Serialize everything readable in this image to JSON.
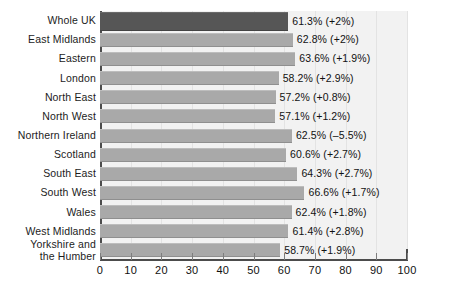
{
  "chart_data": {
    "type": "bar",
    "orientation": "horizontal",
    "title": "",
    "subtitle": "",
    "xlabel": "",
    "ylabel": "",
    "xlim": [
      0,
      100
    ],
    "grid": true,
    "legend": null,
    "series_name": "Percentage (change)",
    "categories": [
      "Whole UK",
      "East Midlands",
      "Eastern",
      "London",
      "North East",
      "North West",
      "Northern Ireland",
      "Scotland",
      "South East",
      "South West",
      "Wales",
      "West Midlands",
      "Yorkshire and the Humber"
    ],
    "values": [
      61.3,
      62.8,
      63.6,
      58.2,
      57.2,
      57.1,
      62.5,
      60.6,
      64.3,
      66.6,
      62.4,
      61.4,
      58.7
    ],
    "changes": [
      "+2%",
      "+2%",
      "+1.9%",
      "+2.9%",
      "+0.8%",
      "+1.2%",
      "-5.5%",
      "+2.7%",
      "+2.7%",
      "+1.7%",
      "+1.8%",
      "+2.8%",
      "+1.9%"
    ],
    "data_labels": [
      "61.3% (+2%)",
      "62.8% (+2%)",
      "63.6% (+1.9%)",
      "58.2% (+2.9%)",
      "57.2% (+0.8%)",
      "57.1% (+1.2%)",
      "62.5% (–5.5%)",
      "60.6% (+2.7%)",
      "64.3% (+2.7%)",
      "66.6% (+1.7%)",
      "62.4% (+1.8%)",
      "61.4% (+2.8%)",
      "58.7% (+1.9%)"
    ],
    "xticks": [
      0,
      10,
      20,
      30,
      40,
      50,
      60,
      70,
      80,
      90,
      100
    ],
    "xtick_labels": [
      "0",
      "10",
      "20",
      "30",
      "40",
      "50",
      "60",
      "70",
      "80",
      "90",
      "100"
    ],
    "highlight_index": 0,
    "colors": {
      "highlight_bar": "#565656",
      "bar": "#a9a9a9",
      "plot_background": "#f2f2f2",
      "axis": "#4c4c4c",
      "gridline": "#e3e3e3",
      "text": "#111111"
    }
  },
  "rows": [
    {
      "label": "Whole UK",
      "label2": "",
      "value_label": "61.3% (+2%)"
    },
    {
      "label": "East Midlands",
      "label2": "",
      "value_label": "62.8% (+2%)"
    },
    {
      "label": "Eastern",
      "label2": "",
      "value_label": "63.6% (+1.9%)"
    },
    {
      "label": "London",
      "label2": "",
      "value_label": "58.2% (+2.9%)"
    },
    {
      "label": "North East",
      "label2": "",
      "value_label": "57.2% (+0.8%)"
    },
    {
      "label": "North West",
      "label2": "",
      "value_label": "57.1% (+1.2%)"
    },
    {
      "label": "Northern Ireland",
      "label2": "",
      "value_label": "62.5% (–5.5%)"
    },
    {
      "label": "Scotland",
      "label2": "",
      "value_label": "60.6% (+2.7%)"
    },
    {
      "label": "South East",
      "label2": "",
      "value_label": "64.3% (+2.7%)"
    },
    {
      "label": "South West",
      "label2": "",
      "value_label": "66.6% (+1.7%)"
    },
    {
      "label": "Wales",
      "label2": "",
      "value_label": "62.4% (+1.8%)"
    },
    {
      "label": "West Midlands",
      "label2": "",
      "value_label": "61.4% (+2.8%)"
    },
    {
      "label": "Yorkshire and",
      "label2": "the Humber",
      "value_label": "58.7% (+1.9%)"
    }
  ]
}
